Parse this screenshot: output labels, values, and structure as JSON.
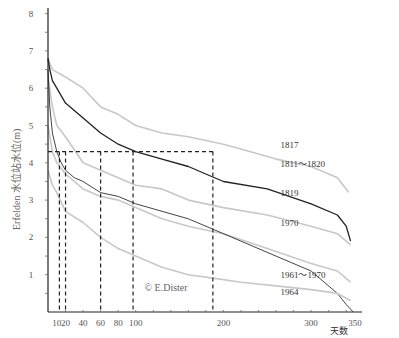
{
  "chart_data": {
    "type": "line",
    "title": "",
    "xlabel": "天数",
    "ylabel": "Erfelden 水位站水位(m)",
    "xlim": [
      0,
      350
    ],
    "ylim": [
      0,
      8
    ],
    "grid": false,
    "legend_position": "inline labels at right",
    "x_ticks": [
      10,
      20,
      40,
      60,
      80,
      100,
      200,
      300,
      350
    ],
    "x_tick_labels": [
      "10",
      "20",
      "40",
      "60",
      "80",
      "100",
      "200",
      "300",
      "350"
    ],
    "y_ticks": [
      1,
      2,
      3,
      4,
      5,
      6,
      7,
      8
    ],
    "y_tick_labels": [
      "1",
      "2",
      "3",
      "4",
      "5",
      "6",
      "7",
      "8"
    ],
    "series": [
      {
        "name": "1817",
        "color": "#c8c8c8",
        "style": "light",
        "x": [
          0,
          5,
          20,
          40,
          60,
          80,
          100,
          130,
          160,
          200,
          230,
          260,
          300,
          330,
          343
        ],
        "y": [
          6.8,
          6.5,
          6.3,
          6.0,
          5.5,
          5.3,
          5.0,
          4.8,
          4.7,
          4.5,
          4.3,
          4.1,
          3.9,
          3.6,
          3.2
        ]
      },
      {
        "name": "1811～1820",
        "color": "#222222",
        "style": "dark",
        "x": [
          0,
          2,
          5,
          10,
          20,
          40,
          60,
          80,
          100,
          130,
          160,
          200,
          250,
          300,
          330,
          340,
          345
        ],
        "y": [
          6.8,
          6.5,
          6.2,
          6.0,
          5.6,
          5.2,
          4.8,
          4.5,
          4.3,
          4.1,
          3.9,
          3.5,
          3.3,
          2.9,
          2.6,
          2.3,
          1.9
        ]
      },
      {
        "name": "1819",
        "color": "#c8c8c8",
        "style": "light",
        "x": [
          0,
          5,
          10,
          20,
          40,
          60,
          80,
          100,
          130,
          160,
          200,
          250,
          300,
          330,
          345
        ],
        "y": [
          6.3,
          5.5,
          5.0,
          4.7,
          4.0,
          3.8,
          3.6,
          3.4,
          3.3,
          3.0,
          2.8,
          2.6,
          2.3,
          2.1,
          1.8
        ]
      },
      {
        "name": "1970",
        "color": "#c8c8c8",
        "style": "light",
        "x": [
          0,
          5,
          10,
          20,
          40,
          60,
          80,
          100,
          130,
          160,
          200,
          250,
          300,
          330,
          345
        ],
        "y": [
          5.0,
          4.3,
          4.0,
          3.7,
          3.3,
          3.1,
          3.0,
          2.8,
          2.5,
          2.3,
          2.1,
          1.7,
          1.3,
          1.1,
          0.8
        ]
      },
      {
        "name": "1961～1970",
        "color": "#444444",
        "style": "medium",
        "x": [
          0,
          2,
          5,
          10,
          15,
          20,
          30,
          40,
          60,
          80,
          100,
          130,
          160,
          190,
          220,
          260,
          300,
          330,
          340,
          348
        ],
        "y": [
          6.5,
          5.5,
          4.8,
          4.3,
          4.0,
          3.8,
          3.6,
          3.5,
          3.2,
          3.1,
          2.9,
          2.7,
          2.5,
          2.2,
          1.9,
          1.5,
          1.1,
          0.5,
          0.2,
          0.0
        ]
      },
      {
        "name": "1964",
        "color": "#c8c8c8",
        "style": "light",
        "x": [
          0,
          5,
          10,
          20,
          40,
          60,
          80,
          100,
          130,
          160,
          190,
          220,
          260,
          300,
          330,
          345
        ],
        "y": [
          3.8,
          3.4,
          3.2,
          2.7,
          2.4,
          2.0,
          1.7,
          1.5,
          1.2,
          1.0,
          0.9,
          0.8,
          0.7,
          0.6,
          0.5,
          0.3
        ]
      }
    ],
    "reference_lines": {
      "horizontal": {
        "y": 4.3,
        "x_from": 0,
        "x_to": 188,
        "style": "dashed"
      },
      "vertical": [
        {
          "x": 13,
          "y_to": 4.3
        },
        {
          "x": 20,
          "y_to": 4.3
        },
        {
          "x": 60,
          "y_to": 4.3
        },
        {
          "x": 97,
          "y_to": 4.3
        },
        {
          "x": 188,
          "y_to": 4.3
        }
      ]
    },
    "annotations": [
      {
        "text": "1817",
        "x": 265,
        "y": 4.4
      },
      {
        "text": "1811～1820",
        "x": 265,
        "y": 3.9
      },
      {
        "text": "1819",
        "x": 265,
        "y": 3.1
      },
      {
        "text": "1970",
        "x": 265,
        "y": 2.3
      },
      {
        "text": "1961～1970",
        "x": 265,
        "y": 0.9
      },
      {
        "text": "1964",
        "x": 265,
        "y": 0.45
      },
      {
        "text": "© E.Dister",
        "x": 110,
        "y": 0.55
      }
    ]
  },
  "labels": {
    "xlabel": "天数",
    "ylabel": "Erfelden 水位站水位(m)",
    "copyright": "© E.Dister"
  }
}
